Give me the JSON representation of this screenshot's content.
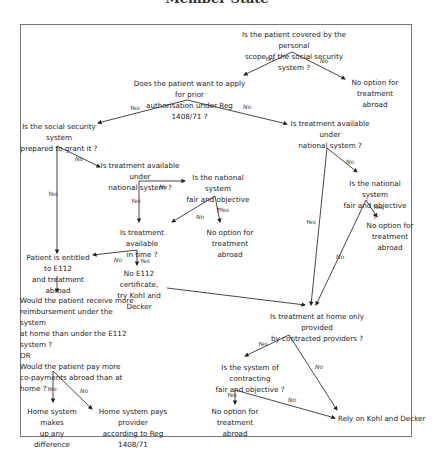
{
  "title": "Member State",
  "nodes": {
    "q_covered": "Is the patient covered by the personal\nscope of the social security system ?",
    "no_option_1": "No option for\ntreatment abroad",
    "q_prior_auth": "Does the patient want to apply for prior\nauthorisation under Reg 1408/71 ?",
    "q_prepared": "Is the social security system\nprepared to grant it ?",
    "q_available_right": "Is treatment available under\nnational system ?",
    "q_available_mid": "Is treatment available under\nnational system ?",
    "q_fair_mid": "Is the national system\nfair and objective ?",
    "q_fair_right": "Is the national system\nfair and objective ?",
    "q_in_time": "Is treatment available\nin time ?",
    "no_option_2": "No option for\ntreatment abroad",
    "no_option_3": "No option for\ntreatment abroad",
    "entitled_e112": "Patient is entitled to E112\nand treatment abroad",
    "no_e112": "No E112 certificate,\ntry Kohl and Decker",
    "q_reimbursement": "Would the patient receive more\nreimbursement under the system\nat home than under the E112 system ?\nOR\nWould the patient pay more\nco-payments abroad than at home ?",
    "q_contracted": "Is treatment at home only provided\nby contracted providers ?",
    "q_contracting_fair": "Is the system of contracting\nfair and objective ?",
    "home_makes_up": "Home system makes\nup any difference",
    "home_pays": "Home system pays provider\naccording to Reg 1408/71",
    "no_option_4": "No option for\ntreatment abroad",
    "rely_kohl": "Rely on Kohl and Decker"
  },
  "edge_labels": {
    "yes": "Yes",
    "no": "No"
  }
}
